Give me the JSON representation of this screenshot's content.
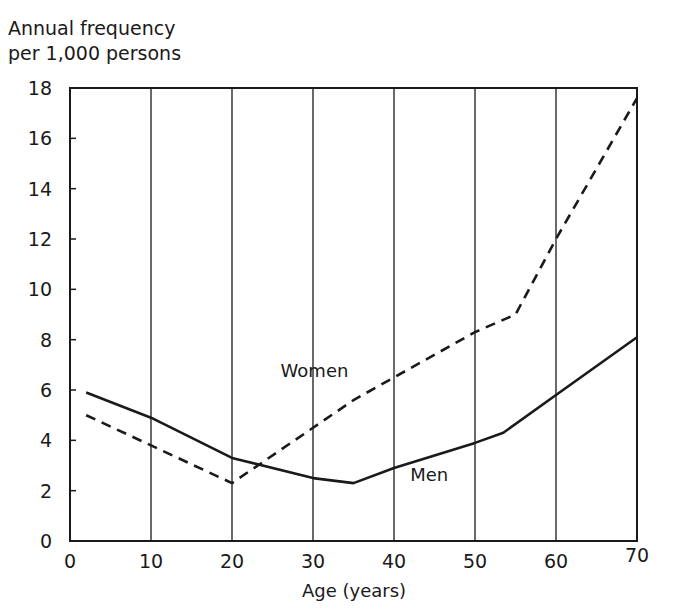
{
  "chart_data": {
    "type": "line",
    "title": "",
    "xlabel": "Age (years)",
    "ylabel": "Annual frequency per 1,000 persons",
    "ylabel_lines": [
      "Annual frequency",
      "per 1,000 persons"
    ],
    "xlim": [
      0,
      70
    ],
    "ylim": [
      0,
      18
    ],
    "x_ticks": [
      0,
      10,
      20,
      30,
      40,
      50,
      60,
      70
    ],
    "y_ticks": [
      0,
      2,
      4,
      6,
      8,
      10,
      12,
      14,
      16,
      18
    ],
    "grid": {
      "vertical": true,
      "horizontal": false
    },
    "legend": "inline labels",
    "series": [
      {
        "name": "Women",
        "style": "dashed",
        "x": [
          2,
          10,
          20,
          30,
          35,
          40,
          50,
          55,
          60,
          70
        ],
        "y": [
          5.0,
          3.8,
          2.3,
          4.5,
          5.6,
          6.5,
          8.3,
          9.0,
          12.0,
          17.6
        ],
        "label_pos": {
          "x": 26,
          "y": 6.5
        }
      },
      {
        "name": "Men",
        "style": "solid",
        "x": [
          2,
          10,
          20,
          30,
          35,
          40,
          50,
          53.5,
          60,
          70
        ],
        "y": [
          5.9,
          4.9,
          3.3,
          2.5,
          2.3,
          2.9,
          3.9,
          4.3,
          5.8,
          8.1
        ],
        "label_pos": {
          "x": 42,
          "y": 2.4
        }
      }
    ]
  }
}
